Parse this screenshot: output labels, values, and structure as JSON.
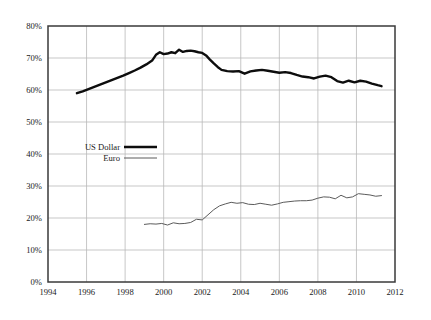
{
  "chart_data": {
    "type": "line",
    "title": "",
    "xlabel": "",
    "ylabel": "",
    "xlim": [
      1994,
      2012
    ],
    "ylim": [
      0,
      80
    ],
    "grid": true,
    "legend_position": "inside-left",
    "x_tick_labels": [
      "1994",
      "1996",
      "1998",
      "2000",
      "2002",
      "2004",
      "2006",
      "2008",
      "2010",
      "2012"
    ],
    "x_ticks": [
      1994,
      1996,
      1998,
      2000,
      2002,
      2004,
      2006,
      2008,
      2010,
      2012
    ],
    "y_tick_labels": [
      "0%",
      "10%",
      "20%",
      "30%",
      "40%",
      "50%",
      "60%",
      "70%",
      "80%"
    ],
    "y_ticks": [
      0,
      10,
      20,
      30,
      40,
      50,
      60,
      70,
      80
    ],
    "series": [
      {
        "name": "US Dollar",
        "color": "#0d0d0d",
        "width": "thick",
        "x": [
          1995.5,
          1995.8,
          1996.1,
          1996.4,
          1996.7,
          1997.0,
          1997.3,
          1997.6,
          1997.9,
          1998.2,
          1998.5,
          1998.8,
          1999.1,
          1999.4,
          1999.6,
          1999.8,
          2000.0,
          2000.2,
          2000.4,
          2000.6,
          2000.8,
          2001.0,
          2001.2,
          2001.4,
          2001.6,
          2001.8,
          2002.0,
          2002.2,
          2002.4,
          2002.6,
          2002.8,
          2003.0,
          2003.3,
          2003.6,
          2003.9,
          2004.2,
          2004.5,
          2004.8,
          2005.1,
          2005.4,
          2005.7,
          2006.0,
          2006.3,
          2006.6,
          2006.9,
          2007.2,
          2007.5,
          2007.8,
          2008.1,
          2008.4,
          2008.7,
          2009.0,
          2009.3,
          2009.6,
          2009.9,
          2010.2,
          2010.5,
          2010.8,
          2011.1,
          2011.3
        ],
        "y": [
          59.0,
          59.6,
          60.3,
          61.0,
          61.7,
          62.4,
          63.1,
          63.8,
          64.5,
          65.3,
          66.1,
          67.0,
          68.0,
          69.2,
          71.0,
          71.8,
          71.2,
          71.4,
          71.8,
          71.5,
          72.6,
          71.9,
          72.2,
          72.3,
          72.1,
          71.8,
          71.6,
          70.8,
          69.5,
          68.3,
          67.2,
          66.3,
          65.9,
          65.8,
          65.9,
          65.1,
          65.8,
          66.1,
          66.3,
          66.0,
          65.7,
          65.4,
          65.6,
          65.3,
          64.7,
          64.2,
          64.0,
          63.6,
          64.2,
          64.5,
          64.0,
          62.8,
          62.3,
          62.9,
          62.4,
          62.9,
          62.6,
          62.0,
          61.5,
          61.2
        ]
      },
      {
        "name": "Euro",
        "color": "#5b5b5b",
        "width": "thin",
        "x": [
          1999.0,
          1999.3,
          1999.6,
          1999.9,
          2000.2,
          2000.5,
          2000.8,
          2001.1,
          2001.4,
          2001.7,
          2002.0,
          2002.3,
          2002.6,
          2002.9,
          2003.2,
          2003.5,
          2003.8,
          2004.1,
          2004.4,
          2004.7,
          2005.0,
          2005.3,
          2005.6,
          2005.9,
          2006.2,
          2006.5,
          2006.8,
          2007.1,
          2007.4,
          2007.7,
          2008.0,
          2008.3,
          2008.6,
          2008.9,
          2009.2,
          2009.5,
          2009.8,
          2010.1,
          2010.4,
          2010.7,
          2011.0,
          2011.3
        ],
        "y": [
          18.0,
          18.2,
          18.1,
          18.3,
          17.8,
          18.5,
          18.2,
          18.3,
          18.6,
          19.6,
          19.4,
          21.0,
          22.6,
          23.8,
          24.4,
          24.9,
          24.6,
          24.8,
          24.3,
          24.2,
          24.6,
          24.3,
          24.0,
          24.4,
          24.9,
          25.1,
          25.3,
          25.4,
          25.4,
          25.6,
          26.2,
          26.6,
          26.5,
          26.0,
          27.1,
          26.3,
          26.6,
          27.6,
          27.4,
          27.2,
          26.8,
          27.0
        ]
      }
    ]
  },
  "legend": {
    "items": [
      {
        "label": "US Dollar",
        "style": "thick-line"
      },
      {
        "label": "Euro",
        "style": "thin-line"
      }
    ]
  },
  "colors": {
    "usd_line": "#0d0d0d",
    "euro_line": "#5b5b5b",
    "grid": "#b9b9b9",
    "frame": "#3a3a3a",
    "background": "#ffffff",
    "text": "#1a1a1a"
  }
}
